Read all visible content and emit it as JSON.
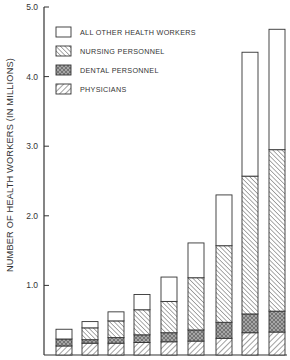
{
  "chart_data": {
    "type": "bar",
    "stacked": true,
    "title": "",
    "xlabel": "",
    "ylabel": "NUMBER OF HEALTH WORKERS (IN MILLIONS)",
    "ylim": [
      0,
      5.0
    ],
    "yticks": [
      1.0,
      2.0,
      3.0,
      4.0,
      5.0
    ],
    "ytick_labels": [
      "1.0",
      "2.0",
      "3.0",
      "4.0",
      "5.0"
    ],
    "grid": false,
    "legend_position": "upper left",
    "categories": [
      "1",
      "2",
      "3",
      "4",
      "5",
      "6",
      "7",
      "8",
      "9"
    ],
    "series": [
      {
        "name": "PHYSICIANS",
        "pattern": "diagonal-forward",
        "values": [
          0.13,
          0.17,
          0.17,
          0.18,
          0.19,
          0.2,
          0.24,
          0.32,
          0.33
        ]
      },
      {
        "name": "DENTAL PERSONNEL",
        "pattern": "crosshatch",
        "values": [
          0.1,
          0.05,
          0.08,
          0.11,
          0.13,
          0.16,
          0.23,
          0.27,
          0.3
        ]
      },
      {
        "name": "NURSING PERSONNEL",
        "pattern": "diagonal-back",
        "values": [
          0.0,
          0.17,
          0.24,
          0.36,
          0.45,
          0.75,
          1.1,
          1.98,
          2.32
        ]
      },
      {
        "name": "ALL OTHER HEALTH WORKERS",
        "pattern": "none",
        "values": [
          0.14,
          0.09,
          0.13,
          0.22,
          0.35,
          0.5,
          0.73,
          1.78,
          1.73
        ]
      }
    ],
    "totals": [
      0.37,
      0.48,
      0.62,
      0.87,
      1.12,
      1.61,
      2.3,
      4.35,
      4.68
    ]
  },
  "legend": {
    "items": [
      {
        "label": "ALL OTHER HEALTH WORKERS",
        "pattern": "none"
      },
      {
        "label": "NURSING PERSONNEL",
        "pattern": "diagonal-back"
      },
      {
        "label": "DENTAL PERSONNEL",
        "pattern": "crosshatch"
      },
      {
        "label": "PHYSICIANS",
        "pattern": "diagonal-forward"
      }
    ]
  },
  "colors": {
    "ink": "#333333",
    "background": "#ffffff"
  }
}
